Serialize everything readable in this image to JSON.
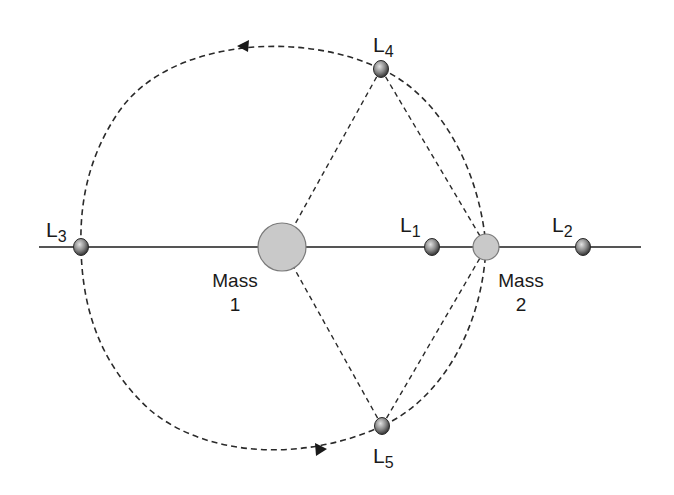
{
  "diagram": {
    "colors": {
      "line": "#555555",
      "dash": "#2a2a2a",
      "mass_fill": "#c9c9c9",
      "mass_stroke": "#7a7a7a",
      "point_dark": "#3a3a3a",
      "point_light": "#d8d8d8",
      "text": "#1a1a1a"
    },
    "masses": [
      {
        "name": "Mass 1",
        "line1": "Mass",
        "line2": "1",
        "cx": 282,
        "cy": 247,
        "r": 24
      },
      {
        "name": "Mass 2",
        "line1": "Mass",
        "line2": "2",
        "cx": 486,
        "cy": 247,
        "r": 13
      }
    ],
    "points": [
      {
        "id": "L1",
        "letter": "L",
        "sub": "1",
        "cx": 432,
        "cy": 247
      },
      {
        "id": "L2",
        "letter": "L",
        "sub": "2",
        "cx": 583,
        "cy": 247
      },
      {
        "id": "L3",
        "letter": "L",
        "sub": "3",
        "cx": 81,
        "cy": 247
      },
      {
        "id": "L4",
        "letter": "L",
        "sub": "4",
        "cx": 381,
        "cy": 69
      },
      {
        "id": "L5",
        "letter": "L",
        "sub": "5",
        "cx": 382,
        "cy": 426
      }
    ],
    "axis": {
      "x1": 39,
      "x2": 641,
      "y": 247
    },
    "orbit_direction": "counter-clockwise"
  }
}
